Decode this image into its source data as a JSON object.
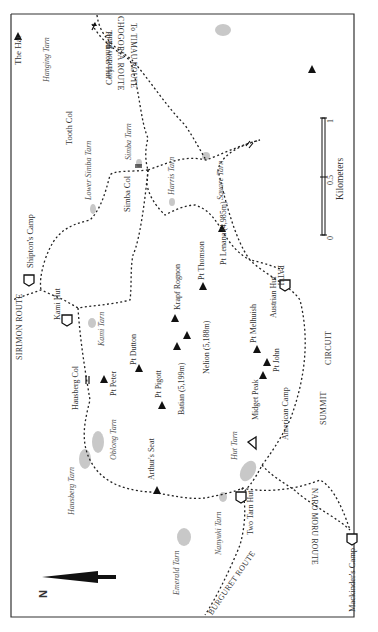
{
  "map": {
    "title": "Mount Kenya summit area",
    "frame_color": "#333333",
    "tarn_color": "#c8c8c8",
    "path_color": "#222222",
    "north_label": "N",
    "scale": {
      "unit_label": "Kilometers",
      "ticks": [
        "0",
        "0.5",
        "1"
      ]
    },
    "routes": {
      "chogoria": "CHOGORIA ROUTE",
      "timau": "To TIMAU ROUTE",
      "minto": "To Minto's Hut",
      "sirimon": "SIRIMON ROUTE",
      "burguret": "BURGURET ROUTE",
      "naro_moru": "NARO MORU ROUTE",
      "summit_circuit_1": "SUMMIT",
      "summit_circuit_2": "CIRCUIT",
      "summit_circuit_3": "PATH"
    },
    "peaks": {
      "the_hat": "The Hat",
      "coryndon": "Coryndon Peak",
      "lenana": "Pt Lenana (4,985m)",
      "thomson": "Pt Thomson",
      "krapf": "Krapf Rognon",
      "nelion": "Nelion (5,188m)",
      "batian": "Batian (5,199m)",
      "melhuish": "Pt Melhuish",
      "john": "Pt John",
      "midget": "Midget Peak",
      "dutton": "Pt Dutton",
      "peter": "Pt Peter",
      "pigott": "Pt Pigott",
      "arthurs_seat": "Arthur's Seat"
    },
    "huts": {
      "shiptons": "Shipton's Camp",
      "kami": "Kami Hut",
      "austrian": "Austrian Hut",
      "american": "American Camp",
      "two_tarn": "Two Tarn Hut",
      "mackinders": "Mackinder's Camp"
    },
    "cols": {
      "tooth": "Tooth Col",
      "simba": "Simba Col",
      "hausberg": "Hausberg Col"
    },
    "tarns": {
      "hanging": "Hanging Tarn",
      "lower_simba": "Lower Simba Tarn",
      "simba": "Simba Tarn",
      "harris": "Harris Tarn",
      "square": "Square Tarn",
      "kami": "Kami Tarn",
      "oblong": "Oblong Tarn",
      "hausberg": "Hausberg Tarn",
      "hut": "Hut Tarn",
      "nanyuki": "Nanyuki Tarn",
      "emerald": "Emerald Tarn"
    }
  }
}
